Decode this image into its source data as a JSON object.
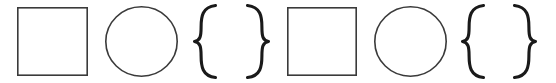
{
  "canvas": {
    "width": 556,
    "height": 83,
    "background_color": "#ffffff",
    "description": "Row of eight outlined geometric glyphs"
  },
  "style": {
    "outline_color": "#3a3a3a",
    "outline_width": 1.6,
    "brace_color": "#1a1a1a",
    "brace_width": 3.1
  },
  "glyphs": [
    {
      "index": 0,
      "name": "square",
      "symbol": "□",
      "x": 17,
      "y": 7,
      "width": 71,
      "height": 69,
      "color": "#3a3a3a",
      "stroke_width": 1.6
    },
    {
      "index": 1,
      "name": "circle",
      "symbol": "○",
      "x": 105,
      "y": 6,
      "width": 73,
      "height": 71,
      "color": "#3a3a3a",
      "stroke_width": 1.6
    },
    {
      "index": 2,
      "name": "left-curly-brace",
      "symbol": "{",
      "x": 194,
      "y": 5,
      "width": 22,
      "height": 73,
      "color": "#1a1a1a",
      "stroke_width": 3.1
    },
    {
      "index": 3,
      "name": "right-curly-brace",
      "symbol": "}",
      "x": 247,
      "y": 5,
      "width": 22,
      "height": 73,
      "color": "#1a1a1a",
      "stroke_width": 3.1
    },
    {
      "index": 4,
      "name": "square",
      "symbol": "□",
      "x": 287,
      "y": 7,
      "width": 70,
      "height": 69,
      "color": "#3a3a3a",
      "stroke_width": 1.6
    },
    {
      "index": 5,
      "name": "circle",
      "symbol": "○",
      "x": 374,
      "y": 6,
      "width": 73,
      "height": 71,
      "color": "#3a3a3a",
      "stroke_width": 1.6
    },
    {
      "index": 6,
      "name": "left-curly-brace",
      "symbol": "{",
      "x": 462,
      "y": 5,
      "width": 22,
      "height": 73,
      "color": "#1a1a1a",
      "stroke_width": 3.1
    },
    {
      "index": 7,
      "name": "right-curly-brace",
      "symbol": "}",
      "x": 514,
      "y": 5,
      "width": 22,
      "height": 73,
      "color": "#1a1a1a",
      "stroke_width": 3.1
    }
  ]
}
